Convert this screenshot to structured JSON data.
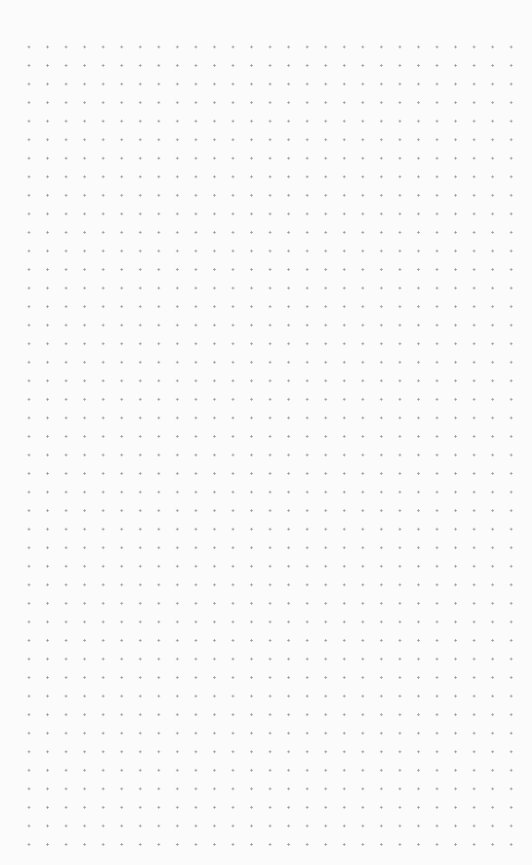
{
  "canvas": {
    "type": "dot-grid",
    "background_color": "#fbfbfb",
    "dot_color": "#9a9a9a",
    "columns": 27,
    "rows": 44,
    "spacing_px": 18.55
  }
}
